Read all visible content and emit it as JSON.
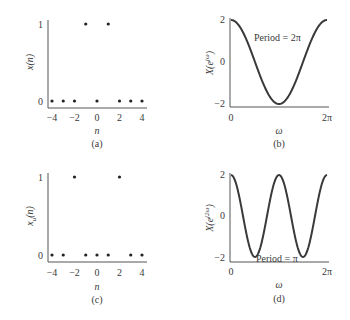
{
  "colors": {
    "ink": "#3a3a3a",
    "axis": "#555555",
    "background": "#ffffff"
  },
  "panels": [
    {
      "id": "a",
      "caption": "(a)",
      "ylabel": "x(n)",
      "xlabel": "n",
      "xticks": [
        "−4",
        "−2",
        "0",
        "2",
        "4"
      ],
      "yticks": [
        "0",
        "1"
      ]
    },
    {
      "id": "b",
      "caption": "(b)",
      "ylabel_base": "X(e",
      "ylabel_sup": "jω",
      "ylabel_close": ")",
      "xlabel": "ω",
      "xticks": [
        "0",
        "2π"
      ],
      "yticks": [
        "2",
        "0",
        "−2"
      ],
      "annotation": "Period = 2π"
    },
    {
      "id": "c",
      "caption": "(c)",
      "ylabel_base": "x",
      "ylabel_sub": "u",
      "ylabel_rest": "(n)",
      "xlabel": "n",
      "xticks": [
        "−4",
        "−2",
        "0",
        "2",
        "4"
      ],
      "yticks": [
        "0",
        "1"
      ]
    },
    {
      "id": "d",
      "caption": "(d)",
      "ylabel_base": "X(e",
      "ylabel_sup": "j2ω",
      "ylabel_close": ")",
      "xlabel": "ω",
      "xticks": [
        "0",
        "2π"
      ],
      "yticks": [
        "2",
        "0",
        "−2"
      ],
      "annotation": "Period = π"
    }
  ],
  "chart_data": [
    {
      "type": "scatter",
      "panel": "(a)",
      "title": "",
      "xlabel": "n",
      "ylabel": "x(n)",
      "x": [
        -4,
        -3,
        -2,
        -1,
        0,
        1,
        2,
        3,
        4
      ],
      "values": [
        0,
        0,
        0,
        1,
        0,
        1,
        0,
        0,
        0
      ],
      "xlim": [
        -4,
        4
      ],
      "ylim": [
        0,
        1
      ],
      "grid": false
    },
    {
      "type": "line",
      "panel": "(b)",
      "title": "",
      "xlabel": "ω",
      "ylabel": "X(e^{jω})",
      "function": "2cos(ω)",
      "x": [
        "0",
        "π/2",
        "π",
        "3π/2",
        "2π"
      ],
      "values": [
        2,
        0,
        -2,
        0,
        2
      ],
      "xlim": [
        "0",
        "2π"
      ],
      "ylim": [
        -2,
        2
      ],
      "annotation": "Period = 2π",
      "grid": false
    },
    {
      "type": "scatter",
      "panel": "(c)",
      "title": "",
      "xlabel": "n",
      "ylabel": "x_u(n)",
      "x": [
        -4,
        -3,
        -2,
        -1,
        0,
        1,
        2,
        3,
        4
      ],
      "values": [
        0,
        0,
        1,
        0,
        0,
        0,
        1,
        0,
        0
      ],
      "xlim": [
        -4,
        4
      ],
      "ylim": [
        0,
        1
      ],
      "grid": false
    },
    {
      "type": "line",
      "panel": "(d)",
      "title": "",
      "xlabel": "ω",
      "ylabel": "X(e^{j2ω})",
      "function": "2cos(2ω)",
      "x": [
        "0",
        "π/4",
        "π/2",
        "3π/4",
        "π",
        "5π/4",
        "3π/2",
        "7π/4",
        "2π"
      ],
      "values": [
        2,
        0,
        -2,
        0,
        2,
        0,
        -2,
        0,
        2
      ],
      "xlim": [
        "0",
        "2π"
      ],
      "ylim": [
        -2,
        2
      ],
      "annotation": "Period = π",
      "grid": false
    }
  ]
}
